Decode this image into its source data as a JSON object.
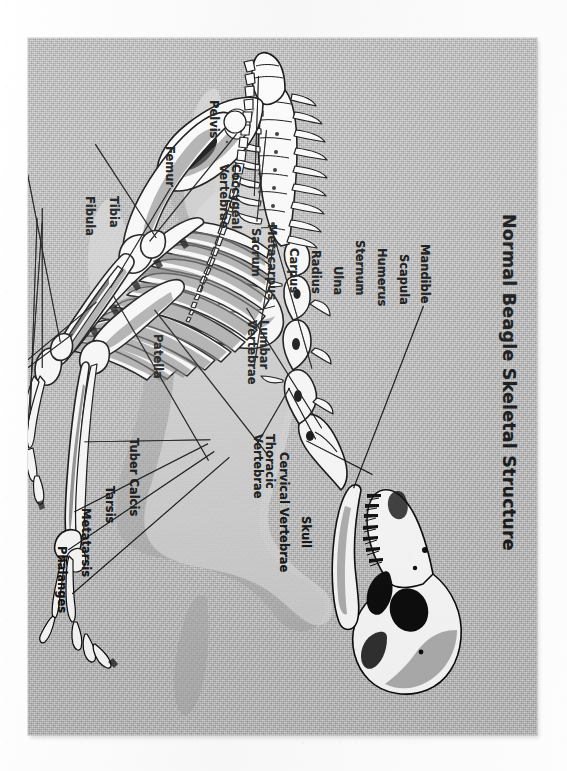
{
  "document": {
    "type": "anatomical-illustration",
    "title": "Normal Beagle Skeletal Structure",
    "orientation": "title and labels rotated 90 degrees clockwise on the page",
    "background_color": "#b9b9b9",
    "paper_color": "#fbfbfb",
    "ink_color": "#0d0f10"
  },
  "labels": {
    "mandible": "Mandible",
    "scapula": "Scapula",
    "humerus": "Humerus",
    "sternum": "Sternum",
    "ulna": "Ulna",
    "radius": "Radius",
    "carpus": "Carpus",
    "metacarpus": "Metacarpus",
    "skull": "Skull",
    "cervical_vertebrae": "Cervical Vertebrae",
    "thoracic_vertebrae_l1": "Thoracic",
    "thoracic_vertebrae_l2": "Vertebrae",
    "lumbar_vertebrae_l1": "Lumbar",
    "lumbar_vertebrae_l2": "Vertebrae",
    "sacrum": "Sacrum",
    "coccygeal_vertebrae_l1": "Coccygeal",
    "coccygeal_vertebrae_l2": "Vertebrae",
    "pelvis": "Pelvis",
    "femur": "Femur",
    "tibia": "Tibia",
    "fibula": "Fibula",
    "patella": "Patella",
    "tuber_calcis": "Tuber Calcis",
    "tarsis": "Tarsis",
    "metatarsis": "Metatarsis",
    "phalanges": "Phalanges"
  },
  "label_list": [
    "Mandible",
    "Scapula",
    "Humerus",
    "Sternum",
    "Ulna",
    "Radius",
    "Carpus",
    "Metacarpus",
    "Skull",
    "Cervical Vertebrae",
    "Thoracic Vertebrae",
    "Lumbar Vertebrae",
    "Sacrum",
    "Coccygeal Vertebrae",
    "Pelvis",
    "Femur",
    "Tibia",
    "Fibula",
    "Patella",
    "Tuber Calcis",
    "Tarsis",
    "Metatarsis",
    "Phalanges"
  ]
}
